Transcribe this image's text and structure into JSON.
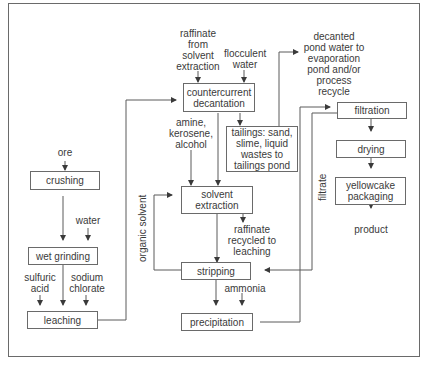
{
  "diagram": {
    "type": "process-flowchart",
    "boxes": {
      "crushing": "crushing",
      "wet_grinding": "wet grinding",
      "leaching": "leaching",
      "countercurrent_decantation": "countercurrent\ndecantation",
      "tailings": "tailings: sand,\nslime, liquid\nwastes to\ntailings pond",
      "solvent_extraction": "solvent\nextraction",
      "stripping": "stripping",
      "precipitation": "precipitation",
      "filtration": "filtration",
      "drying": "drying",
      "yellowcake_packaging": "yellowcake\npackaging"
    },
    "labels": {
      "ore": "ore",
      "water": "water",
      "sulfuric_acid": "sulfuric\nacid",
      "sodium_chlorate": "sodium\nchlorate",
      "raffinate_from_sx": "raffinate\nfrom\nsolvent\nextraction",
      "flocculent_water": "flocculent\nwater",
      "amine_kerosene_alcohol": "amine,\nkerosene,\nalcohol",
      "decanted_pond_water": "decanted\npond water to\nevaporation\npond and/or\nprocess\nrecycle",
      "raffinate_recycled": "raffinate\nrecycled to\nleaching",
      "ammonia": "ammonia",
      "organic_solvent": "organic  solvent",
      "filtrate": "filtrate",
      "product": "product"
    },
    "edges": [
      {
        "from": "ore",
        "to": "crushing"
      },
      {
        "from": "crushing",
        "to": "wet grinding"
      },
      {
        "from": "water",
        "to": "wet grinding"
      },
      {
        "from": "wet grinding",
        "to": "leaching"
      },
      {
        "from": "sulfuric acid",
        "to": "leaching"
      },
      {
        "from": "sodium chlorate",
        "to": "leaching"
      },
      {
        "from": "leaching",
        "to": "countercurrent decantation"
      },
      {
        "from": "raffinate from solvent extraction",
        "to": "countercurrent decantation"
      },
      {
        "from": "flocculent water",
        "to": "countercurrent decantation"
      },
      {
        "from": "countercurrent decantation",
        "to": "tailings"
      },
      {
        "from": "countercurrent decantation",
        "to": "solvent extraction"
      },
      {
        "from": "amine, kerosene, alcohol",
        "to": "solvent extraction"
      },
      {
        "from": "tailings",
        "to": "decanted pond water"
      },
      {
        "from": "solvent extraction",
        "to": "raffinate recycled to leaching"
      },
      {
        "from": "solvent extraction",
        "to": "stripping"
      },
      {
        "from": "stripping",
        "to": "solvent extraction",
        "label": "organic solvent"
      },
      {
        "from": "stripping",
        "to": "precipitation"
      },
      {
        "from": "ammonia",
        "to": "precipitation"
      },
      {
        "from": "precipitation",
        "to": "filtration"
      },
      {
        "from": "filtration",
        "to": "stripping",
        "label": "filtrate"
      },
      {
        "from": "filtration",
        "to": "drying"
      },
      {
        "from": "drying",
        "to": "yellowcake packaging"
      },
      {
        "from": "yellowcake packaging",
        "to": "product"
      }
    ]
  }
}
